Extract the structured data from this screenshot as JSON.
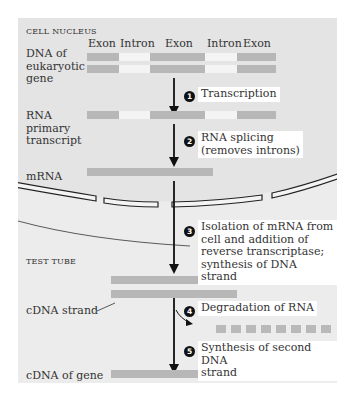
{
  "regions": {
    "cell_nucleus": "Cell nucleus",
    "test_tube": "Test tube"
  },
  "gene_headers": [
    "Exon",
    "Intron",
    "Exon",
    "Intron",
    "Exon"
  ],
  "row_labels": {
    "dna": "DNA of\neukaryotic\ngene",
    "rna_primary": "RNA\nprimary\ntranscript",
    "mrna": "mRNA",
    "cdna_strand": "cDNA strand",
    "cdna_gene": "cDNA of gene\n(no introns)"
  },
  "steps": [
    {
      "number": "1",
      "text": "Transcription"
    },
    {
      "number": "2",
      "text": "RNA splicing\n(removes introns)"
    },
    {
      "number": "3",
      "text": "Isolation of mRNA from\ncell and addition of\nreverse transcriptase;\nsynthesis of DNA strand"
    },
    {
      "number": "4",
      "text": "Degradation of RNA"
    },
    {
      "number": "5",
      "text": "Synthesis of second DNA\nstrand"
    }
  ],
  "colors": {
    "nucleus_bg": "#e4e4e4",
    "test_tube_bg": "#ececec",
    "exon": "#b7b7b7",
    "intron": "#f4f4f4",
    "arrow": "#111111",
    "step_box": "#ffffff"
  }
}
